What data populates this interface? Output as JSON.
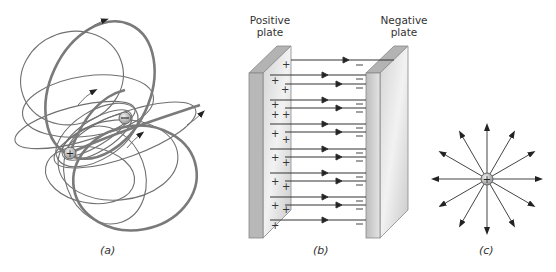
{
  "figure": {
    "panels": [
      {
        "id": "a",
        "caption": "(a)",
        "description": "Field lines around an electric dipole",
        "charges": [
          {
            "sign": "+",
            "x": 70,
            "y": 153
          },
          {
            "sign": "−",
            "x": 125,
            "y": 118
          }
        ]
      },
      {
        "id": "b",
        "caption": "(b)",
        "description": "Uniform field between parallel plates",
        "plate_labels": {
          "positive_line1": "Positive",
          "positive_line2": "plate",
          "negative_line1": "Negative",
          "negative_line2": "plate"
        },
        "positive_symbol": "+",
        "negative_symbol": "−"
      },
      {
        "id": "c",
        "caption": "(c)",
        "description": "Radial field of a point charge",
        "charge_sign": "+",
        "ray_count": 12
      }
    ],
    "colors": {
      "line": "#6a6a6a",
      "thick_line": "#7a7a7a",
      "plate_face": "#c8c8c8",
      "plate_top": "#b5b5b5",
      "arrow": "#222222",
      "charge_fill": "#bdbdbd"
    }
  }
}
